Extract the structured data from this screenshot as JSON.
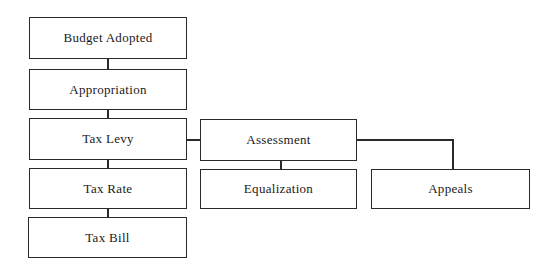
{
  "diagram": {
    "type": "flowchart",
    "nodes": {
      "budget_adopted": "Budget Adopted",
      "appropriation": "Appropriation",
      "tax_levy": "Tax Levy",
      "tax_rate": "Tax Rate",
      "tax_bill": "Tax Bill",
      "assessment": "Assessment",
      "equalization": "Equalization",
      "appeals": "Appeals"
    },
    "edges": [
      [
        "Budget Adopted",
        "Appropriation"
      ],
      [
        "Appropriation",
        "Tax Levy"
      ],
      [
        "Tax Levy",
        "Tax Rate"
      ],
      [
        "Tax Rate",
        "Tax Bill"
      ],
      [
        "Tax Levy",
        "Assessment"
      ],
      [
        "Assessment",
        "Equalization"
      ],
      [
        "Assessment",
        "Appeals"
      ]
    ]
  }
}
